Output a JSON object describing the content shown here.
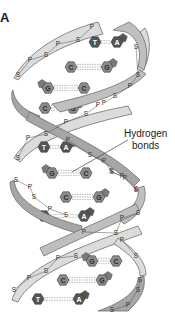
{
  "figure": {
    "panel_label": "A",
    "callout": {
      "line1": "Hydrogen",
      "line2": "bonds"
    },
    "backbone_labels": {
      "sugar": "S",
      "phosphate": "P"
    },
    "colors": {
      "ribbon_light": "#d9d9d9",
      "ribbon_dark": "#a6a6a6",
      "ribbon_stroke": "#6e6e6e",
      "base_hex": "#8c8c8c",
      "base_hex_dark": "#555555",
      "base_pentagon": "#7a7a7a",
      "base_text": "#ffffff",
      "bond_dash": "#8a8a8a"
    },
    "base_pairs": [
      {
        "left": "T",
        "right": "A",
        "y": 42
      },
      {
        "left": "C",
        "right": "G",
        "y": 67
      },
      {
        "left": "G",
        "right": "C",
        "y": 88
      },
      {
        "left": "C",
        "right": "G",
        "y": 108
      },
      {
        "left": "T",
        "right": "A",
        "y": 147
      },
      {
        "left": "G",
        "right": "C",
        "y": 173
      },
      {
        "left": "C",
        "right": "G",
        "y": 197
      },
      {
        "left": "T",
        "right": "A",
        "y": 216
      },
      {
        "left": "G",
        "right": "C",
        "y": 261
      },
      {
        "left": "C",
        "right": "G",
        "y": 280
      },
      {
        "left": "T",
        "right": "A",
        "y": 299
      }
    ]
  }
}
